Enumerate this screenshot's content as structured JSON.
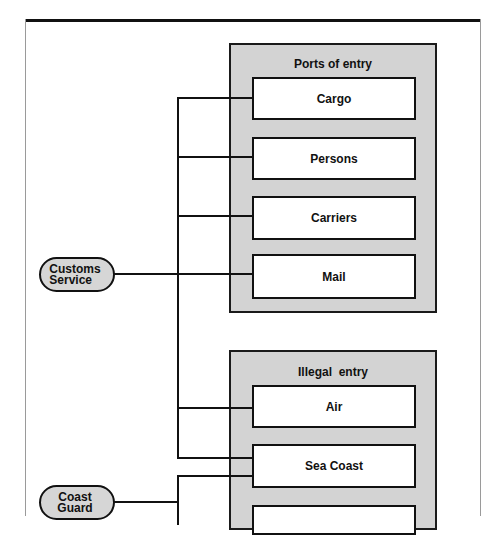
{
  "diagram": {
    "colors": {
      "group_fill": "#d3d3d3",
      "pill_fill": "#d6d6d6",
      "box_fill": "#ffffff",
      "line": "#111111"
    },
    "agencies": [
      {
        "id": "customs",
        "line1": "Customs",
        "line2": "Service"
      },
      {
        "id": "coast_guard",
        "line1": "Coast",
        "line2": "Guard"
      }
    ],
    "groups": [
      {
        "title": "Ports of entry",
        "items": [
          {
            "label": "Cargo"
          },
          {
            "label": "Persons"
          },
          {
            "label": "Carriers"
          },
          {
            "label": "Mail"
          }
        ]
      },
      {
        "title": "Illegal  entry",
        "items": [
          {
            "label": "Air"
          },
          {
            "label": "Sea Coast"
          },
          {
            "label": ""
          }
        ]
      }
    ],
    "connections": [
      {
        "from": "Customs Service",
        "to": [
          "Cargo",
          "Persons",
          "Carriers",
          "Mail",
          "Air",
          "Sea Coast"
        ]
      },
      {
        "from": "Coast Guard",
        "to": [
          "Sea Coast",
          "(cut off)"
        ]
      }
    ]
  }
}
